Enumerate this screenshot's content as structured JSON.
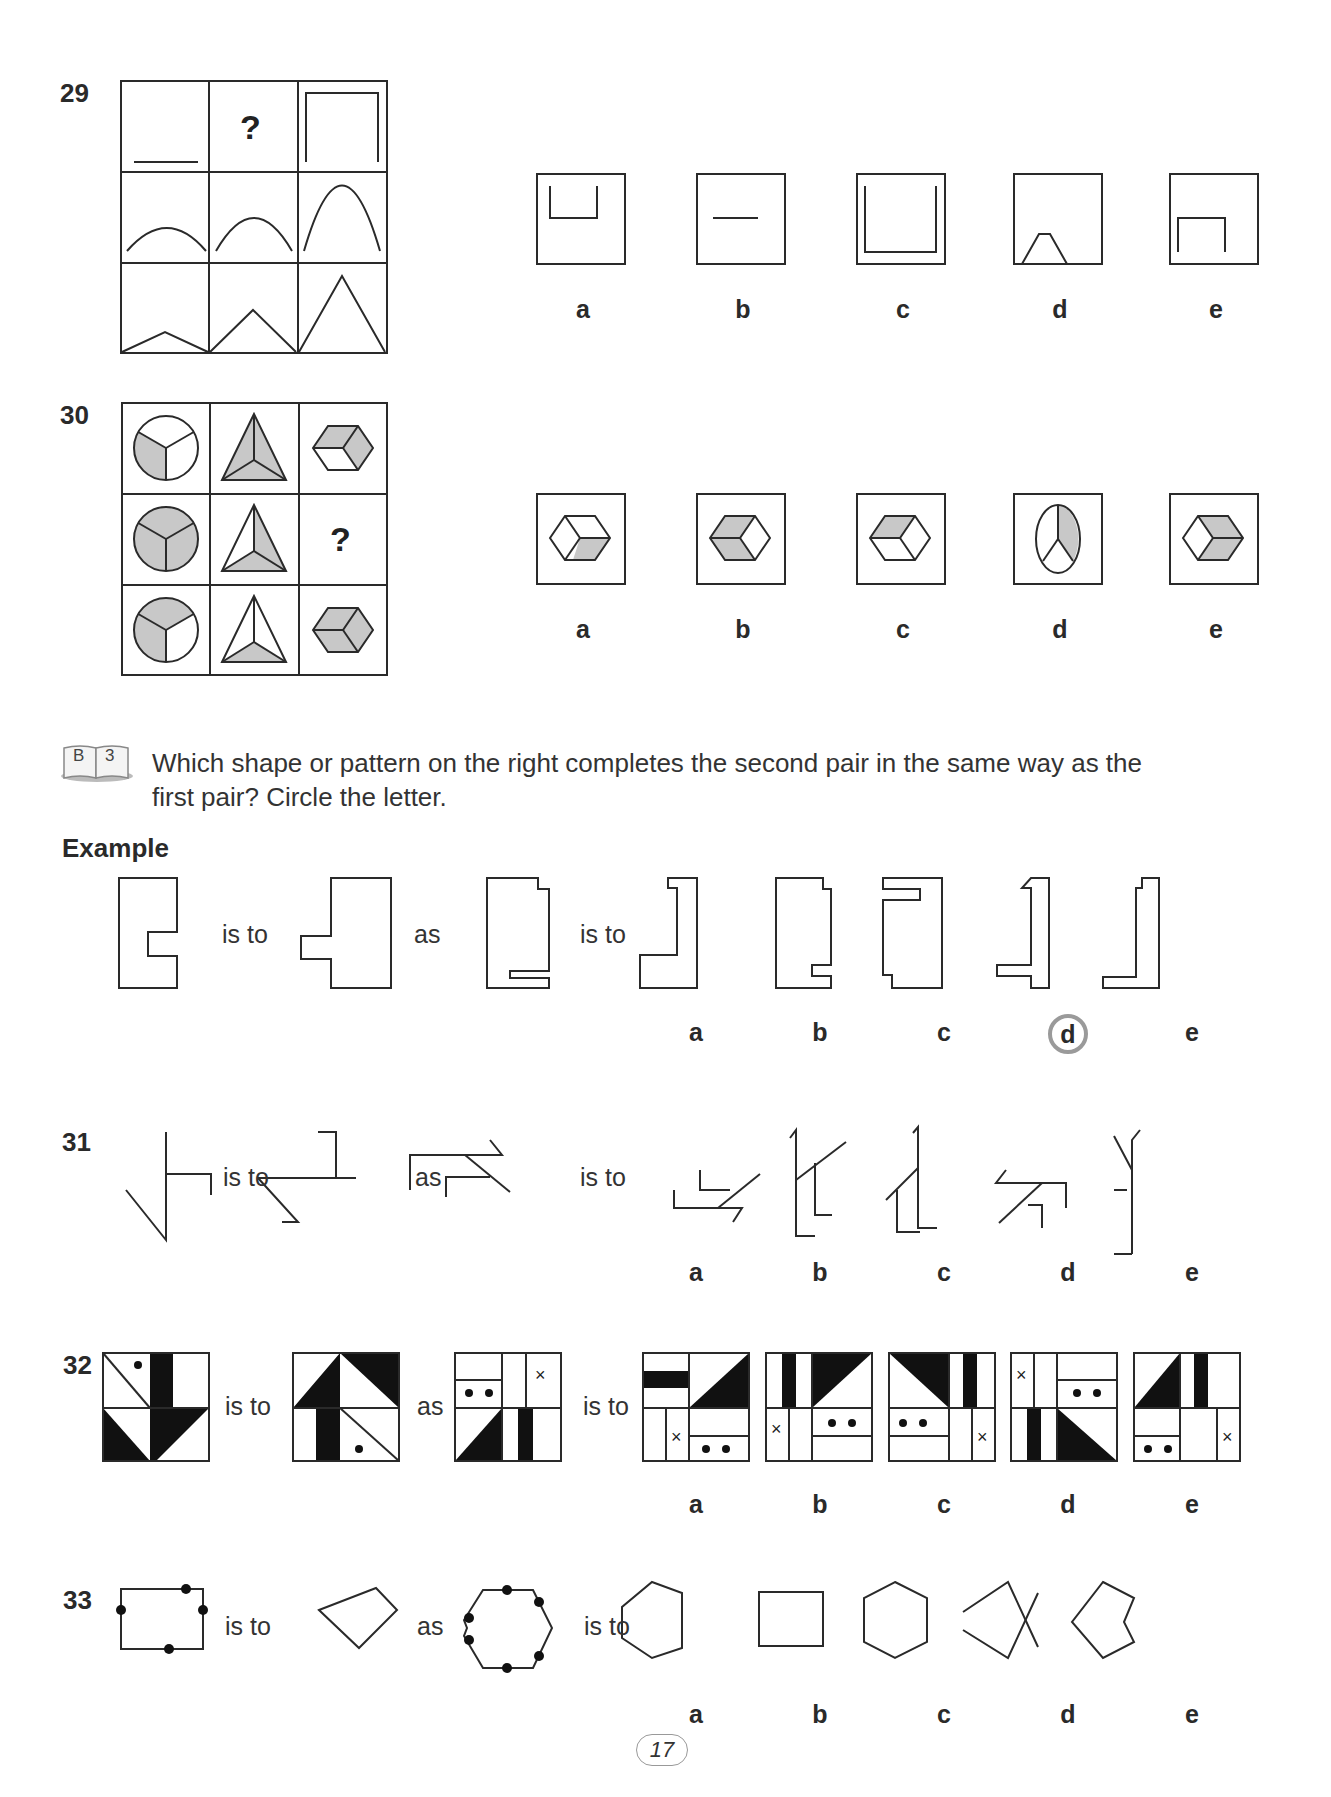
{
  "page_number": "17",
  "questions": {
    "q29": {
      "number": "29",
      "grid_placeholder": "?",
      "options": [
        "a",
        "b",
        "c",
        "d",
        "e"
      ]
    },
    "q30": {
      "number": "30",
      "grid_placeholder": "?",
      "options": [
        "a",
        "b",
        "c",
        "d",
        "e"
      ]
    },
    "q31": {
      "number": "31",
      "options": [
        "a",
        "b",
        "c",
        "d",
        "e"
      ]
    },
    "q32": {
      "number": "32",
      "options": [
        "a",
        "b",
        "c",
        "d",
        "e"
      ]
    },
    "q33": {
      "number": "33",
      "options": [
        "a",
        "b",
        "c",
        "d",
        "e"
      ]
    }
  },
  "section": {
    "book_icon": {
      "left": "B",
      "right": "3"
    },
    "instruction_line1": "Which shape or pattern on the right completes the second pair in the same way as the",
    "instruction_line2": "first pair? Circle the letter.",
    "example_heading": "Example"
  },
  "example": {
    "options": [
      "a",
      "b",
      "c",
      "d",
      "e"
    ],
    "circled_answer": "d"
  },
  "words": {
    "is_to": "is to",
    "as": "as"
  },
  "colors": {
    "ink": "#2a2a2a",
    "shade": "#c8c8c8",
    "circle": "#9a9a9a"
  }
}
